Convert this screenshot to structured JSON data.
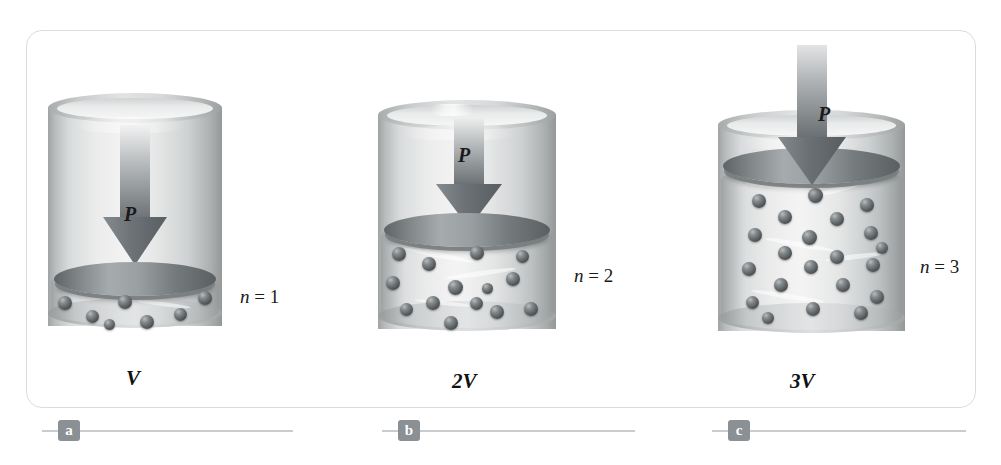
{
  "figure": {
    "frame_color": "#d9dde0",
    "background": "#ffffff"
  },
  "panels": [
    {
      "id": "a",
      "tag": "a",
      "moles_label": "n = 1",
      "moles_symbol": "n",
      "moles_equals": "=",
      "moles_value": "1",
      "volume_label": "V",
      "pressure_label": "P",
      "particle_count": 7,
      "cylinder": {
        "x": 48,
        "y": 93,
        "width": 174,
        "height": 247
      },
      "piston_top_y": 262,
      "arrow_inside": true
    },
    {
      "id": "b",
      "tag": "b",
      "moles_label": "n = 2",
      "moles_symbol": "n",
      "moles_equals": "=",
      "moles_value": "2",
      "volume_label": "2V",
      "pressure_label": "P",
      "particle_count": 14,
      "cylinder": {
        "x": 378,
        "y": 100,
        "width": 178,
        "height": 243
      },
      "piston_top_y": 213,
      "arrow_inside": true
    },
    {
      "id": "c",
      "tag": "c",
      "moles_label": "n = 3",
      "moles_symbol": "n",
      "moles_equals": "=",
      "moles_value": "3",
      "volume_label": "3V",
      "pressure_label": "P",
      "particle_count": 23,
      "cylinder": {
        "x": 718,
        "y": 110,
        "width": 187,
        "height": 235
      },
      "piston_top_y": 148,
      "arrow_inside": false
    }
  ],
  "colors": {
    "glass_light": "#f3f3f3",
    "glass_mid": "#cfd2d3",
    "glass_dark": "#949899",
    "piston_dark": "#5e6365",
    "piston_light": "#a6abad",
    "particle": "#4a4f52",
    "arrow_dark": "#6d7376",
    "arrow_light": "#e9eaea",
    "tag_background": "#8b9094",
    "rule": "#c9cdd0"
  }
}
